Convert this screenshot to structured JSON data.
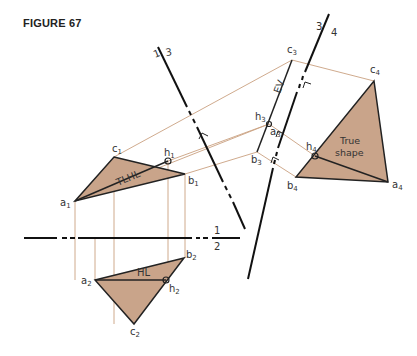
{
  "figure": {
    "title": "FIGURE 67"
  },
  "colors": {
    "fill": "#c9a48a",
    "projection_lines": "#c9a080",
    "lines": "#111111"
  },
  "fold_lines": {
    "f12": {
      "top": "1",
      "bottom": "2"
    },
    "f13": {
      "left": "1",
      "right": "3"
    },
    "f34": {
      "left": "3",
      "right": "4"
    }
  },
  "view1": {
    "points": {
      "a": "a",
      "b": "b",
      "c": "c",
      "h": "h",
      "sub": "1"
    },
    "line_label": "TLHL"
  },
  "view2": {
    "points": {
      "a": "a",
      "b": "b",
      "c": "c",
      "h": "h",
      "sub": "2"
    },
    "line_label": "HL"
  },
  "view3": {
    "points": {
      "a": "a",
      "b": "b",
      "c": "c",
      "h": "h",
      "sub": "3"
    },
    "edge_label": "EV"
  },
  "view4": {
    "points": {
      "a": "a",
      "b": "b",
      "c": "c",
      "h": "h",
      "sub": "4"
    },
    "shape_label_line1": "True",
    "shape_label_line2": "shape"
  }
}
